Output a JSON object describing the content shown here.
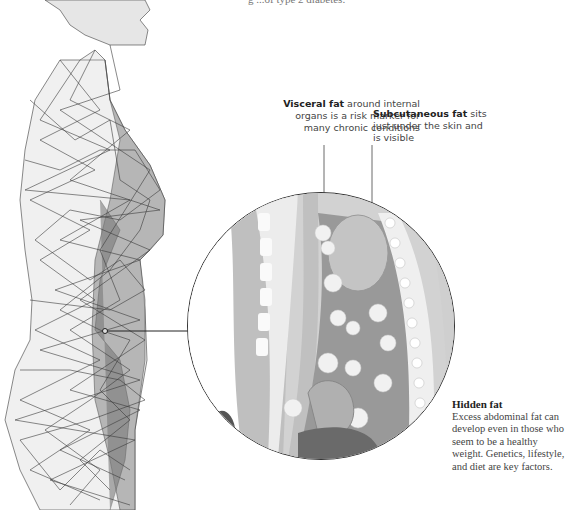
{
  "top_text": {
    "fragment": "g                                        ...of type 2 diabetes."
  },
  "labels": {
    "visceral": {
      "bold": "Visceral fat",
      "rest": " around internal organs is a risk marker for many chronic conditions"
    },
    "subcutaneous": {
      "bold": "Subcutaneous fat",
      "rest": " sits just under the skin and is visible"
    }
  },
  "hidden_fat": {
    "title": "Hidden fat",
    "body": "Excess abdominal fat can develop even in those who seem to be a healthy weight. Genetics, lifestyle, and diet are key factors."
  },
  "colors": {
    "line": "#333333",
    "mesh": "#3a3a3a",
    "tissue_light": "#e8e8e8",
    "tissue_mid": "#bdbdbd",
    "tissue_dark": "#6a6a6a",
    "fat": "#f2f2f2"
  }
}
